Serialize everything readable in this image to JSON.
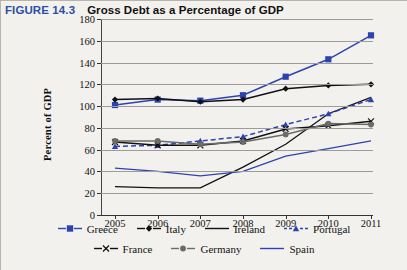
{
  "figure": {
    "number": "FIGURE 14.3",
    "title": "Gross Debt as a Percentage of GDP",
    "number_color": "#2d4fa2"
  },
  "chart_data": {
    "type": "line",
    "title": "Gross Debt as a Percentage of GDP",
    "xlabel": "",
    "ylabel": "Percent of GDP",
    "x": [
      2005,
      2006,
      2007,
      2008,
      2009,
      2010,
      2011
    ],
    "categories": [
      "2005",
      "2006",
      "2007",
      "2008",
      "2009",
      "2010",
      "2011"
    ],
    "xlim": [
      2005,
      2011
    ],
    "ylim": [
      0,
      180
    ],
    "ytick_step": 20,
    "yticks": [
      180,
      160,
      140,
      120,
      100,
      80,
      60,
      40,
      20,
      0
    ],
    "grid": true,
    "grid_axis": "y",
    "legend_position": "bottom",
    "series": [
      {
        "name": "Greece",
        "color": "#2b44b0",
        "marker": "square",
        "dash": "solid",
        "values": [
          101,
          106,
          105,
          110,
          127,
          143,
          165
        ]
      },
      {
        "name": "Italy",
        "color": "#111111",
        "marker": "diamond",
        "dash": "solid",
        "values": [
          106,
          107,
          104,
          106,
          116,
          119,
          120
        ]
      },
      {
        "name": "Ireland",
        "color": "#111111",
        "marker": "none",
        "dash": "solid",
        "values": [
          26,
          25,
          25,
          44,
          65,
          93,
          108
        ]
      },
      {
        "name": "Portugal",
        "color": "#2b44b0",
        "marker": "triangle",
        "dash": "dashed",
        "values": [
          63,
          64,
          68,
          72,
          83,
          93,
          106
        ]
      },
      {
        "name": "France",
        "color": "#111111",
        "marker": "x",
        "dash": "solid",
        "values": [
          67,
          64,
          64,
          68,
          79,
          82,
          86
        ]
      },
      {
        "name": "Germany",
        "color": "#6b6b6b",
        "marker": "circle",
        "dash": "solid",
        "values": [
          68,
          68,
          65,
          67,
          74,
          84,
          83
        ]
      },
      {
        "name": "Spain",
        "color": "#2b44b0",
        "marker": "none",
        "dash": "solid",
        "values": [
          43,
          40,
          36,
          40,
          54,
          61,
          68
        ]
      }
    ]
  }
}
